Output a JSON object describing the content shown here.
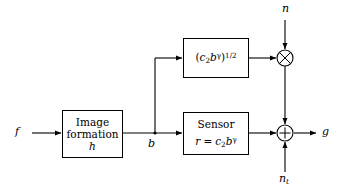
{
  "diagram": {
    "type": "block-diagram",
    "background_color": "#ffffff",
    "line_color": "#000000",
    "canvas": {
      "width": 350,
      "height": 195
    }
  },
  "signals": {
    "input": {
      "name": "f",
      "label": "f",
      "x": 22,
      "y": 133
    },
    "branch": {
      "name": "b",
      "label": "b",
      "x": 155,
      "y": 133
    },
    "noise_multiplicative": {
      "name": "n",
      "label": "n",
      "x": 287,
      "y": 10
    },
    "noise_thermal": {
      "name": "n_t",
      "label_base": "n",
      "label_sub": "t",
      "x": 287,
      "y": 182
    },
    "output": {
      "name": "g",
      "label": "g",
      "x": 327,
      "y": 133
    }
  },
  "blocks": [
    {
      "id": "image-formation",
      "line1": "Image",
      "line2": "formation",
      "line3": "h",
      "x": 62,
      "y": 110,
      "width": 61,
      "height": 48
    },
    {
      "id": "sqrt-gain",
      "expr_open": "(",
      "expr_c": "c",
      "expr_c_sub": "2",
      "expr_b": "b",
      "expr_b_sup": "γ",
      "expr_close": ")",
      "expr_power": "1/2",
      "x": 183,
      "y": 38,
      "width": 66,
      "height": 40
    },
    {
      "id": "sensor",
      "line1": "Sensor",
      "eq_lhs": "r",
      "eq_sign": "=",
      "eq_c": "c",
      "eq_c_sub": "2",
      "eq_b": "b",
      "eq_b_sup": "γ",
      "x": 183,
      "y": 112,
      "width": 66,
      "height": 43
    }
  ],
  "operators": [
    {
      "id": "multiplier",
      "glyph": "⊗",
      "symbol_name": "multiply-circle",
      "x": 285,
      "y": 58,
      "radius": 8
    },
    {
      "id": "adder",
      "glyph": "⊕",
      "symbol_name": "plus-circle",
      "x": 285,
      "y": 133,
      "radius": 8
    }
  ]
}
